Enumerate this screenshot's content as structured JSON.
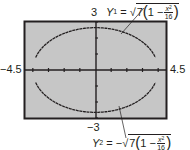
{
  "chart_data": {
    "type": "line",
    "title": "",
    "xlabel": "",
    "ylabel": "",
    "xlim": [
      -4.5,
      4.5
    ],
    "ylim": [
      -3,
      3
    ],
    "xscale": 1,
    "yscale": 1,
    "grid": false,
    "axis_labels": {
      "x_min": "−4.5",
      "x_max": "4.5",
      "y_max": "3",
      "y_min": "−3"
    },
    "series": [
      {
        "name": "Y1",
        "expression": "sqrt(7(1 - x^2/16))",
        "label_prefix": "Y",
        "label_index": "1",
        "label_sign": "",
        "label_radicand_coef": "7",
        "label_inner": "1 −",
        "label_num": "x",
        "label_num_exp": "2",
        "label_den": "16",
        "x": [
          -4,
          -3.5,
          -3,
          -2.5,
          -2,
          -1.5,
          -1,
          -0.5,
          0,
          0.5,
          1,
          1.5,
          2,
          2.5,
          3,
          3.5,
          4
        ],
        "values": [
          0,
          1.28,
          1.75,
          2.07,
          2.29,
          2.45,
          2.56,
          2.62,
          2.65,
          2.62,
          2.56,
          2.45,
          2.29,
          2.07,
          1.75,
          1.28,
          0
        ]
      },
      {
        "name": "Y2",
        "expression": "-sqrt(7(1 - x^2/16))",
        "label_prefix": "Y",
        "label_index": "2",
        "label_sign": "−",
        "label_radicand_coef": "7",
        "label_inner": "1 −",
        "label_num": "x",
        "label_num_exp": "2",
        "label_den": "16",
        "x": [
          -4,
          -3.5,
          -3,
          -2.5,
          -2,
          -1.5,
          -1,
          -0.5,
          0,
          0.5,
          1,
          1.5,
          2,
          2.5,
          3,
          3.5,
          4
        ],
        "values": [
          0,
          -1.28,
          -1.75,
          -2.07,
          -2.29,
          -2.45,
          -2.56,
          -2.62,
          -2.65,
          -2.62,
          -2.56,
          -2.45,
          -2.29,
          -2.07,
          -1.75,
          -1.28,
          0
        ]
      }
    ]
  },
  "colors": {
    "screen_bg": "#c6c6c6",
    "frame": "#231f20",
    "curve": "#231f20",
    "text": "#231f20"
  },
  "equals": "="
}
